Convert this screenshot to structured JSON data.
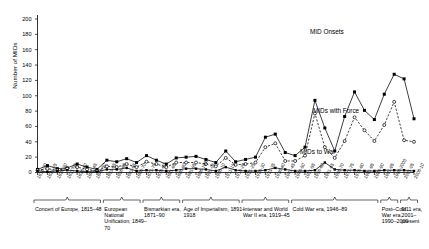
{
  "chart_data": {
    "type": "line",
    "title": "",
    "xlabel": "",
    "ylabel": "Number of MIDs",
    "ylim": [
      0,
      200
    ],
    "ytick_step": 20,
    "grid": false,
    "legend_position": "inline-annotation",
    "categories": [
      "1816-20",
      "1821-25",
      "1826-30",
      "1831-35",
      "1836-40",
      "1841-45",
      "1846-50",
      "1851-55",
      "1856-60",
      "1861-65",
      "1866-70",
      "1871-75",
      "1876-80",
      "1881-85",
      "1886-90",
      "1891-95",
      "1896-1900",
      "1901-05",
      "1906-10",
      "1911-15",
      "1916-20",
      "1921-25",
      "1926-30",
      "1931-35",
      "1936-40",
      "1941-45",
      "1946-50",
      "1951-55",
      "1956-60",
      "1961-65",
      "1966-70",
      "1971-75",
      "1976-80",
      "1981-85",
      "1986-90",
      "1991-95",
      "1996-2000",
      "2001-05",
      "2006-10"
    ],
    "ytick_labels": [
      "0",
      "20",
      "40",
      "60",
      "80",
      "100",
      "120",
      "140",
      "160",
      "180",
      "200"
    ],
    "series": [
      {
        "name": "MID Onsets",
        "marker": "filled-square",
        "line": "solid",
        "values": [
          4,
          9,
          5,
          6,
          11,
          7,
          4,
          16,
          14,
          18,
          13,
          22,
          16,
          11,
          19,
          20,
          21,
          17,
          13,
          28,
          14,
          17,
          20,
          46,
          50,
          26,
          22,
          33,
          94,
          58,
          28,
          73,
          105,
          81,
          69,
          102,
          128,
          122,
          70
        ]
      },
      {
        "name": "MIDs with Force",
        "marker": "open-circle",
        "line": "dashed",
        "values": [
          3,
          5,
          3,
          5,
          7,
          4,
          2,
          8,
          7,
          11,
          7,
          14,
          11,
          7,
          13,
          13,
          13,
          11,
          8,
          19,
          10,
          11,
          13,
          33,
          38,
          15,
          15,
          22,
          77,
          33,
          19,
          41,
          72,
          55,
          41,
          62,
          92,
          42,
          40
        ]
      },
      {
        "name": "MIDs to War",
        "marker": "filled-square-small",
        "line": "solid",
        "values": [
          2,
          1,
          2,
          3,
          2,
          1,
          1,
          4,
          4,
          6,
          2,
          3,
          3,
          2,
          3,
          5,
          5,
          4,
          2,
          7,
          3,
          2,
          2,
          3,
          6,
          4,
          2,
          2,
          3,
          13,
          4,
          3,
          3,
          2,
          2,
          3,
          3,
          3,
          2
        ]
      }
    ],
    "annotations": [
      {
        "name": "mid-onsets-label",
        "text": "MID Onsets"
      },
      {
        "name": "mids-with-force-label",
        "text": "MIDs with Force"
      },
      {
        "name": "mids-to-war-label",
        "text": "MIDs to War"
      }
    ]
  },
  "eras": [
    {
      "text": "Concert of Europe, 1815–48",
      "start_index": 0,
      "end_index": 6
    },
    {
      "text": "European National Unification, 1849–70",
      "start_index": 7,
      "end_index": 10
    },
    {
      "text": "Bismarkian era, 1871–90",
      "start_index": 11,
      "end_index": 14
    },
    {
      "text": "Age of Imperialism, 1891–1918",
      "start_index": 15,
      "end_index": 20
    },
    {
      "text": "Interwar and World War II era, 1919–45",
      "start_index": 21,
      "end_index": 25
    },
    {
      "text": "Cold War era, 1946–89",
      "start_index": 26,
      "end_index": 34
    },
    {
      "text": "Post–Cold War era, 1990–2000",
      "start_index": 35,
      "end_index": 36
    },
    {
      "text": "9/11 era, 2001–present",
      "start_index": 37,
      "end_index": 38
    }
  ],
  "colors": {
    "axis": "#000000",
    "series": "#000000",
    "background": "#ffffff"
  }
}
